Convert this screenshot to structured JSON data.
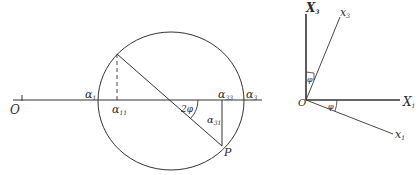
{
  "left_figure": {
    "title": "Mohr circle construction",
    "origin_label": "O",
    "labels": {
      "alpha1": "α",
      "alpha1_sub": "1",
      "alpha11": "α",
      "alpha11_sub": "11",
      "alpha33": "α",
      "alpha33_sub": "33",
      "alpha3": "α",
      "alpha3_sub": "3",
      "alpha31": "α",
      "alpha31_sub": "31",
      "angle": "2φ",
      "point": "P"
    }
  },
  "right_figure": {
    "title": "Axis rotation",
    "origin_label": "O",
    "labels": {
      "X3": "X",
      "X3_sub": "3",
      "x3": "x",
      "x3_sub": "3",
      "X1": "X",
      "X1_sub": "1",
      "x1": "x",
      "x1_sub": "1",
      "phi_top": "φ",
      "phi_bottom": "φ"
    }
  },
  "colors": {
    "stroke": "#333333",
    "background": "#ffffff"
  }
}
